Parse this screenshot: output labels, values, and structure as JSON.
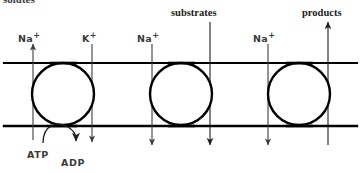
{
  "figure": {
    "kind": "cell-membrane-transport-diagram",
    "cropped_top_text": "solutes",
    "stroke_color": "#000000",
    "thin_stroke_color": "#3c3c3c",
    "background_color": "#ffffff"
  },
  "membrane": {
    "top_line_y": 63,
    "bottom_line_y": 126,
    "left_x": 4,
    "right_x": 357
  },
  "transporters": [
    {
      "name": "sodium-potassium-pump",
      "cx": 63,
      "cy": 94,
      "r": 31
    },
    {
      "name": "sodium-substrate-cotransporter",
      "cx": 181,
      "cy": 94,
      "r": 31
    },
    {
      "name": "sodium-product-exchanger",
      "cx": 299,
      "cy": 94,
      "r": 31
    }
  ],
  "arrows": [
    {
      "id": "na-out",
      "label": "Na",
      "charge": "+",
      "direction": "up",
      "x": 33,
      "label_x": 18,
      "label_y": 34
    },
    {
      "id": "k-in",
      "label": "K",
      "charge": "+",
      "direction": "down",
      "x": 92,
      "label_x": 82,
      "label_y": 34
    },
    {
      "id": "na-in-2",
      "label": "Na",
      "charge": "+",
      "direction": "down",
      "x": 152,
      "label_x": 137,
      "label_y": 34
    },
    {
      "id": "substrates-in",
      "label": "substrates",
      "charge": "",
      "direction": "down",
      "x": 210,
      "label_x": 171,
      "label_y": 8
    },
    {
      "id": "na-in-3",
      "label": "Na",
      "charge": "+",
      "direction": "down",
      "x": 268,
      "label_x": 253,
      "label_y": 34
    },
    {
      "id": "products-out",
      "label": "products",
      "charge": "",
      "direction": "up",
      "x": 328,
      "label_x": 302,
      "label_y": 8
    }
  ],
  "energy": {
    "atp_label": "ATP",
    "adp_label": "ADP",
    "atp_label_x": 27,
    "atp_label_y": 150,
    "adp_label_x": 61,
    "adp_label_y": 158,
    "curve_note": "ATP hydrolysis curved arrow feeding the pump"
  }
}
